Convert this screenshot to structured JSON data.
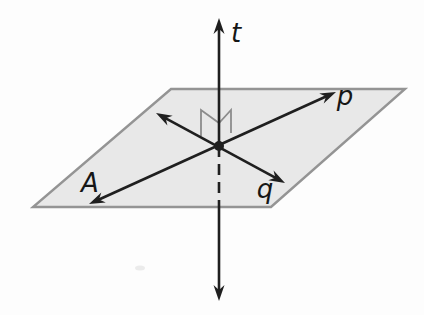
{
  "figure": {
    "canvas": {
      "width": 424,
      "height": 315
    },
    "colors": {
      "background": "#fdfdfd",
      "line": "#1f1f1f",
      "plane_fill": "#e8e8e8",
      "plane_border": "#949494",
      "right_angle_marker": "#8c8c8c",
      "label": "#161616",
      "smudge": "#dcdcdc"
    },
    "plane": {
      "name": "plane-A",
      "points": [
        [
          171,
          89
        ],
        [
          405,
          89
        ],
        [
          271,
          207
        ],
        [
          33,
          207
        ]
      ],
      "border_width": 2.4
    },
    "stroke_width": 2.6,
    "dash_pattern": "11 7",
    "lines": [
      {
        "name": "line-t-upper",
        "from": [
          219,
          146
        ],
        "to": [
          219,
          18
        ],
        "arrow_at_from": false,
        "arrow_at_to": true,
        "dashed": false
      },
      {
        "name": "line-t-hidden",
        "from": [
          219,
          146
        ],
        "to": [
          219,
          207
        ],
        "arrow_at_from": false,
        "arrow_at_to": false,
        "dashed": true
      },
      {
        "name": "line-t-lower",
        "from": [
          219,
          207
        ],
        "to": [
          219,
          301
        ],
        "arrow_at_from": false,
        "arrow_at_to": true,
        "dashed": false
      },
      {
        "name": "line-p",
        "from": [
          89,
          204
        ],
        "to": [
          336,
          92
        ],
        "arrow_at_from": true,
        "arrow_at_to": true,
        "dashed": false
      },
      {
        "name": "line-q",
        "from": [
          156,
          113
        ],
        "to": [
          285,
          183
        ],
        "arrow_at_from": true,
        "arrow_at_to": true,
        "dashed": false
      }
    ],
    "right_angle_marker": {
      "name": "perpendicular-marker",
      "points": [
        [
          201,
          136
        ],
        [
          201,
          110
        ],
        [
          219,
          123
        ],
        [
          231,
          110
        ],
        [
          231,
          133
        ]
      ],
      "width": 1.8
    },
    "intersection_dot": {
      "cx": 219,
      "cy": 146,
      "r": 5
    },
    "labels": [
      {
        "name": "label-t",
        "text": "t",
        "x": 236,
        "y": 42
      },
      {
        "name": "label-p",
        "text": "p",
        "x": 345,
        "y": 105
      },
      {
        "name": "label-q",
        "text": "q",
        "x": 265,
        "y": 198
      },
      {
        "name": "label-A",
        "text": "A",
        "x": 90,
        "y": 192
      }
    ],
    "smudge": {
      "cx": 140,
      "cy": 268,
      "rx": 5,
      "ry": 2.5,
      "opacity": 0.55
    }
  }
}
